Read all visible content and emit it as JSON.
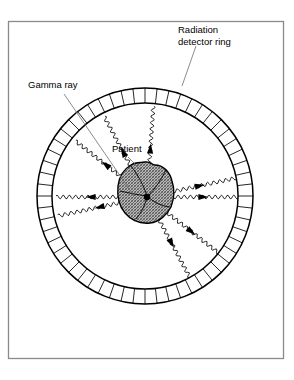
{
  "figure": {
    "background_color": "#ffffff",
    "border_color": "#8a8a8a",
    "ink_color": "#000000"
  },
  "labels": {
    "detector_ring": {
      "line1": "Radiation",
      "line2": "detector ring",
      "x": 178,
      "y": 33
    },
    "gamma_ray": {
      "text": "Gamma ray",
      "x": 28,
      "y": 88
    },
    "patient": {
      "text": "Patient",
      "x": 112,
      "y": 152
    }
  },
  "detector_ring": {
    "center_x": 145,
    "center_y": 196,
    "outer_radius": 108,
    "inner_radius": 93,
    "segment_count": 56,
    "fill": "#ffffff",
    "stroke": "#000000"
  },
  "patient": {
    "center_x": 145,
    "center_y": 192,
    "radius_x": 25,
    "radius_y": 30,
    "fill_pattern": "crosshatch-gray",
    "fill_color": "#9a9a9a",
    "outline_color": "#000000"
  },
  "annihilation_point": {
    "x": 147,
    "y": 197,
    "radius": 3.2
  },
  "chart_data": {
    "type": "diagram",
    "annotations": [
      "Radiation detector ring",
      "Gamma ray",
      "Patient"
    ],
    "gamma_rays": [
      {
        "angle_deg": 180,
        "label": "left-horizontal",
        "arrow_at": 0.55
      },
      {
        "angle_deg": 0,
        "label": "right-horizontal",
        "arrow_at": 0.55
      },
      {
        "angle_deg": 168,
        "label": "left-upper",
        "arrow_at": 0.45
      },
      {
        "angle_deg": 348,
        "label": "right-lower",
        "arrow_at": 0.52
      },
      {
        "angle_deg": 62,
        "label": "upper-right-steep",
        "arrow_at": 0.5
      },
      {
        "angle_deg": 242,
        "label": "lower-left-steep",
        "arrow_at": 0.48
      },
      {
        "angle_deg": 38,
        "label": "upper-right-shallow",
        "arrow_at": 0.55
      },
      {
        "angle_deg": 218,
        "label": "lower-left-shallow",
        "arrow_at": 0.5
      },
      {
        "angle_deg": 274,
        "label": "lower-vertical",
        "arrow_at": 0.45
      }
    ]
  }
}
